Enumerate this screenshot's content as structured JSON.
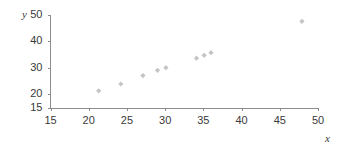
{
  "chart_data": {
    "type": "scatter",
    "title": "",
    "xlabel": "x",
    "ylabel": "y",
    "xlim": [
      15,
      50
    ],
    "ylim": [
      15,
      50
    ],
    "grid": false,
    "legend": false,
    "x_ticks": [
      15,
      20,
      25,
      30,
      35,
      40,
      45,
      50
    ],
    "y_ticks": [
      15,
      20,
      30,
      40,
      50
    ],
    "x_tick_labels": [
      "15",
      "20",
      "25",
      "30",
      "35",
      "40",
      "45",
      "50"
    ],
    "y_tick_labels": [
      "15",
      "20",
      "30",
      "40",
      "50"
    ],
    "marker_color": "#c4c4c4",
    "axis_color": "#8c8c8c",
    "points": [
      {
        "x": 21.3,
        "y": 21.2
      },
      {
        "x": 24.2,
        "y": 23.8
      },
      {
        "x": 27.1,
        "y": 27.0
      },
      {
        "x": 29.0,
        "y": 29.0
      },
      {
        "x": 30.1,
        "y": 30.0
      },
      {
        "x": 34.1,
        "y": 33.6
      },
      {
        "x": 35.1,
        "y": 34.7
      },
      {
        "x": 36.0,
        "y": 35.7
      },
      {
        "x": 47.9,
        "y": 47.6
      }
    ]
  },
  "axes": {
    "y_title": "y",
    "x_title": "x"
  }
}
